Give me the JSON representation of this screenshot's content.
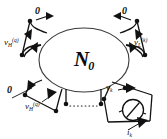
{
  "figure": {
    "name": "multiport-network-diagram",
    "background": "#ffffff",
    "ink": "#111111",
    "width": 167,
    "height": 139,
    "network": {
      "label_main": "N",
      "label_sub": "0",
      "shape": "ellipse"
    },
    "ports": [
      {
        "id": "port-top-left",
        "label": "0",
        "kind": "short-circuit",
        "arrow": true
      },
      {
        "id": "port-top-right",
        "label": "0",
        "kind": "short-circuit",
        "arrow": true
      },
      {
        "id": "port-left",
        "label_main": "v",
        "label_sub": "H",
        "label_sup": "(q)",
        "kind": "voltage-source",
        "arrow": true
      },
      {
        "id": "port-right",
        "label_main": "v",
        "label_sub": "L",
        "label_sup": "(k)",
        "kind": "voltage-source",
        "arrow": true
      },
      {
        "id": "port-bottom-left-zero",
        "label": "0",
        "kind": "short-circuit",
        "arrow": true
      },
      {
        "id": "port-bottom-left-source",
        "label_main": "v",
        "label_sub": "H",
        "label_sup": "(q)",
        "kind": "voltage-source",
        "arrow": true
      },
      {
        "id": "port-measured",
        "voltage_main": "v",
        "voltage_sub": "k",
        "current_main": "i",
        "current_sub": "k",
        "kind": "measured-port",
        "meter": "ammeter-circle-slash"
      }
    ],
    "ellipsis": {
      "name": "dotted-ellipsis",
      "style": "dotted"
    }
  }
}
